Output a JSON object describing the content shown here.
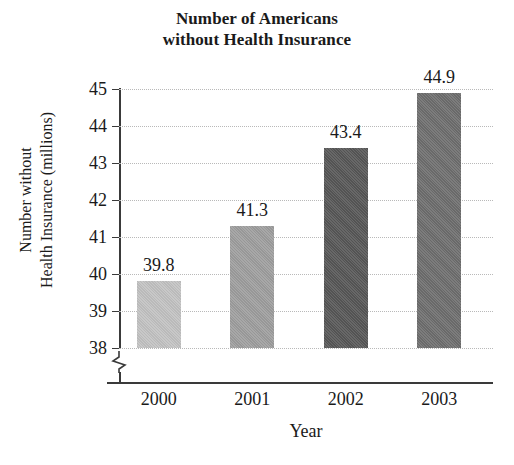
{
  "chart_data": {
    "type": "bar",
    "title": "Number of Americans without Health Insurance",
    "title_lines": [
      "Number of Americans",
      "without Health Insurance"
    ],
    "categories": [
      "2000",
      "2001",
      "2002",
      "2003"
    ],
    "values": [
      39.8,
      41.3,
      43.4,
      44.9
    ],
    "value_labels": [
      "39.8",
      "41.3",
      "43.4",
      "44.9"
    ],
    "xlabel": "Year",
    "ylabel": "Number without Health Insurance (millions)",
    "ylabel_lines": [
      "Number without",
      "Health Insurance (millions)"
    ],
    "ylim": [
      38,
      45
    ],
    "ytick_labels": [
      "45",
      "44",
      "43",
      "42",
      "41",
      "40",
      "39",
      "38"
    ],
    "ytick_values": [
      45,
      44,
      43,
      42,
      41,
      40,
      39,
      38
    ],
    "grid": true,
    "legend": null,
    "axis_break": true,
    "bar_colors": [
      "#c2c2c2",
      "#9e9e9e",
      "#575757",
      "#6e6e6e"
    ],
    "axis_color": "#3a3a3a",
    "grid_color": "#b9b9b9"
  }
}
